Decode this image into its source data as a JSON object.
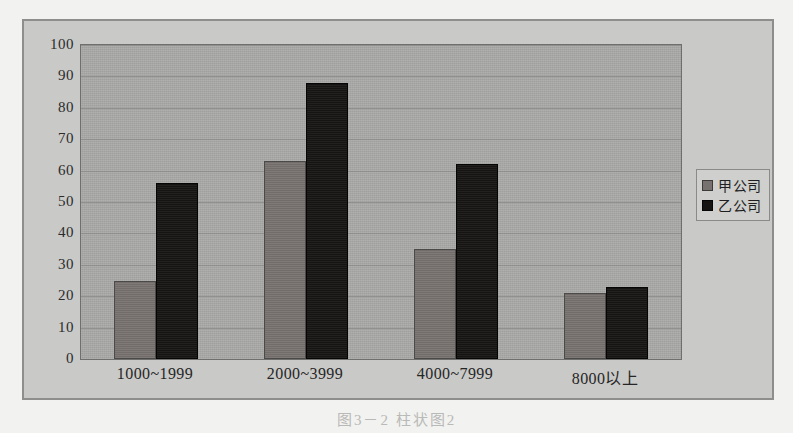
{
  "figure": {
    "caption": "图3－2 柱状图2"
  },
  "legend": {
    "position": "right",
    "items": [
      {
        "label": "甲公司",
        "swatch": "series-a-swatch",
        "color": "#77726f"
      },
      {
        "label": "乙公司",
        "swatch": "series-b-swatch",
        "color": "#161514"
      }
    ]
  },
  "colors": {
    "page_background": "#f2f2f0",
    "figure_background": "#c9c9c7",
    "plot_background": "#a8a8a6",
    "gridline": "#8c8c8a",
    "series_a": "#77726f",
    "series_b": "#161514",
    "axis_text": "#262626",
    "frame_border": "#8e8e8c"
  },
  "chart_data": {
    "type": "bar",
    "title": "",
    "subtitle": "",
    "xlabel": "",
    "ylabel": "",
    "categories": [
      "1000~1999",
      "2000~3999",
      "4000~7999",
      "8000以上"
    ],
    "series": [
      {
        "name": "甲公司",
        "values": [
          25,
          63,
          35,
          21
        ],
        "color": "#77726f"
      },
      {
        "name": "乙公司",
        "values": [
          56,
          88,
          62,
          23
        ],
        "color": "#161514"
      }
    ],
    "ylim": [
      0,
      100
    ],
    "ytick_labels": [
      "0",
      "10",
      "20",
      "30",
      "40",
      "50",
      "60",
      "70",
      "80",
      "90",
      "100"
    ],
    "ytick_values": [
      0,
      10,
      20,
      30,
      40,
      50,
      60,
      70,
      80,
      90,
      100
    ],
    "grid": true,
    "grid_axis": "y",
    "legend_position": "right",
    "bar_orientation": "vertical",
    "grouped": true
  }
}
